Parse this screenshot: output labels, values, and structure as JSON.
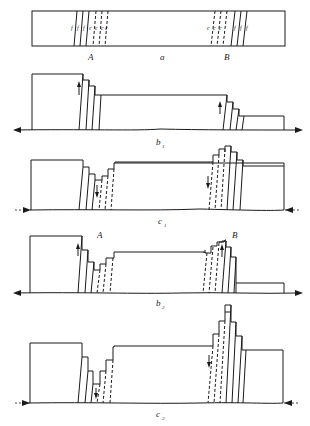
{
  "figure": {
    "panels": [
      {
        "id": "a",
        "label": "a",
        "sub": ""
      },
      {
        "id": "b1",
        "label": "b",
        "sub": "1"
      },
      {
        "id": "c1",
        "label": "c",
        "sub": "1"
      },
      {
        "id": "b2",
        "label": "b",
        "sub": "2"
      },
      {
        "id": "c2",
        "label": "c",
        "sub": "2"
      }
    ],
    "zone_labels": {
      "A": "A",
      "B": "B"
    },
    "fault_labels": {
      "f": "f",
      "c": "c"
    },
    "axis_direction": {
      "b1": "extension (arrows outward)",
      "c1": "compression (arrows inward)",
      "b2": "extension (arrows outward)",
      "c2": "compression (arrows inward)"
    },
    "line_color": "#1a1a1a",
    "background": "#ffffff"
  },
  "labels": {
    "panel_a": "a",
    "panel_b1_main": "b",
    "panel_b1_sub": "1",
    "panel_c1_main": "c",
    "panel_c1_sub": "1",
    "panel_b2_main": "b",
    "panel_b2_sub": "2",
    "panel_c2_main": "c",
    "panel_c2_sub": "2",
    "zone_A_top": "A",
    "zone_B_top": "B",
    "zone_A_b2": "A",
    "zone_B_b2": "B",
    "f": "f",
    "c": "c"
  }
}
